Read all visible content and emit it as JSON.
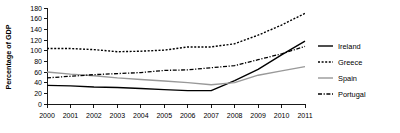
{
  "chart_data": {
    "type": "line",
    "title": "",
    "xlabel": "",
    "ylabel": "Percentage of GDP",
    "categories": [
      "2000",
      "2001",
      "2002",
      "2003",
      "2004",
      "2005",
      "2006",
      "2007",
      "2008",
      "2009",
      "2010",
      "2011"
    ],
    "x": [
      2000,
      2001,
      2002,
      2003,
      2004,
      2005,
      2006,
      2007,
      2008,
      2009,
      2010,
      2011
    ],
    "ylim": [
      0,
      180
    ],
    "xlim": [
      2000,
      2011
    ],
    "yticks": [
      0,
      20,
      40,
      60,
      80,
      100,
      120,
      140,
      160,
      180
    ],
    "grid": false,
    "legend_position": "right",
    "series": [
      {
        "name": "Ireland",
        "style": "solid",
        "color": "#000000",
        "values": [
          35,
          34,
          32,
          31,
          29,
          27,
          25,
          25,
          44,
          65,
          92,
          118
        ]
      },
      {
        "name": "Greece",
        "style": "dotted",
        "color": "#000000",
        "values": [
          104,
          104,
          102,
          98,
          99,
          101,
          107,
          107,
          113,
          129,
          148,
          170
        ]
      },
      {
        "name": "Spain",
        "style": "solid",
        "color": "#999999",
        "values": [
          60,
          56,
          53,
          49,
          46,
          43,
          40,
          36,
          40,
          54,
          62,
          70
        ]
      },
      {
        "name": "Portugal",
        "style": "dashdot",
        "color": "#000000",
        "values": [
          49,
          52,
          55,
          57,
          59,
          63,
          64,
          68,
          72,
          83,
          94,
          108
        ]
      }
    ]
  },
  "legend": {
    "items": [
      {
        "label": "Ireland"
      },
      {
        "label": "Greece"
      },
      {
        "label": "Spain"
      },
      {
        "label": "Portugal"
      }
    ]
  },
  "axes": {
    "y_axis_title": "Percentage of GDP",
    "y_tick_labels": [
      "180",
      "160",
      "140",
      "120",
      "100",
      "80",
      "60",
      "40",
      "20",
      "0"
    ],
    "x_tick_labels": [
      "2000",
      "2001",
      "2002",
      "2003",
      "2004",
      "2005",
      "2006",
      "2007",
      "2008",
      "2009",
      "2010",
      "2011"
    ]
  }
}
